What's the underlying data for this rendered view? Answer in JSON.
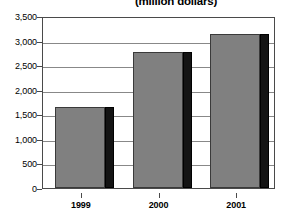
{
  "chart_data": {
    "type": "bar",
    "title": "(million dollars)",
    "xlabel": "",
    "ylabel": "",
    "categories": [
      "1999",
      "2000",
      "2001"
    ],
    "values": [
      1640,
      2760,
      3130
    ],
    "series": [
      {
        "name": "Amount",
        "values": [
          1640,
          2760,
          3130
        ]
      }
    ],
    "ylim": [
      0,
      3500
    ],
    "y_ticks": [
      0,
      500,
      1000,
      1500,
      2000,
      2500,
      3000,
      3500
    ],
    "y_tick_labels": [
      "0",
      "500",
      "1,000",
      "1,500",
      "2,000",
      "2,500",
      "3,000",
      "3,500"
    ],
    "x_tick_labels": [
      "1999",
      "2000",
      "2001"
    ],
    "grid": true,
    "legend": false,
    "legend_position": "none",
    "colors": {
      "bar_fill": "#808080",
      "bar_outline": "#3a3a3a",
      "bar_shadow": "#141414",
      "gridline": "#888888",
      "frame": "#4a4a4a",
      "background": "#ffffff",
      "text": "#000000"
    }
  }
}
